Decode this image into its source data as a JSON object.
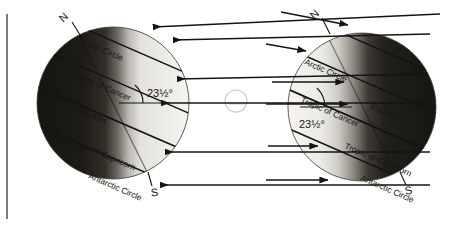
{
  "figure": {
    "axis_tilt_label": "23½°",
    "pole_north_label": "N",
    "pole_south_label": "S",
    "sun_symbol_name": "sun-circle"
  },
  "globes": [
    {
      "id": "left-globe",
      "name": "left-globe",
      "night_side": "left",
      "day_side": "right",
      "tilt_label": "23½°",
      "north_label": "N",
      "south_label": "S",
      "latitude_lines": [
        {
          "label": "Arctic Circle"
        },
        {
          "label": "Tropic of Cancer"
        },
        {
          "label": "Equator"
        },
        {
          "label": "Tropic of Capricorn"
        },
        {
          "label": "Antarctic Circle"
        }
      ]
    },
    {
      "id": "right-globe",
      "name": "right-globe",
      "night_side": "right",
      "day_side": "left",
      "tilt_label": "23½°",
      "north_label": "N",
      "south_label": "S",
      "latitude_lines": [
        {
          "label": "Arctic Circle"
        },
        {
          "label": "Tropic of Cancer"
        },
        {
          "label": "Equator"
        },
        {
          "label": "Tropic of Capricorn"
        },
        {
          "label": "Antarctic Circle"
        }
      ]
    }
  ],
  "rays": {
    "left_group_name": "sun-rays-to-left-globe",
    "right_group_name": "sun-rays-to-right-globe",
    "count_left": 5,
    "count_right": 5,
    "direction_left": "leftward",
    "direction_right": "rightward"
  },
  "colors": {
    "night": "#1c1a18",
    "day": "#f2f0ec",
    "terminator_mid": "#8a8782",
    "line": "#141414",
    "frame": "#5a5a5a",
    "sun_outline": "#c9c9c9",
    "background": "#ffffff"
  }
}
